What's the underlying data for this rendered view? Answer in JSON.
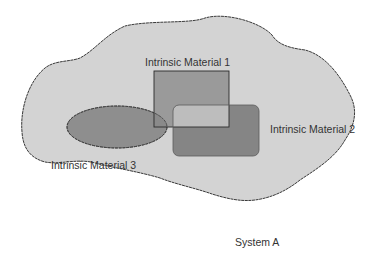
{
  "diagram": {
    "system": {
      "label": "System A",
      "fill": "#d3d3d3",
      "stroke": "#3a3a3a"
    },
    "materials": [
      {
        "id": 1,
        "label": "Intrinsic Material 1",
        "shape": "rectangle",
        "fill": "#9a9a9a"
      },
      {
        "id": 2,
        "label": "Intrinsic Material 2",
        "shape": "rounded-rectangle",
        "fill": "#858585"
      },
      {
        "id": 3,
        "label": "Intrinsic Material 3",
        "shape": "ellipse",
        "fill": "#8e8e8e"
      }
    ],
    "overlaps": {
      "m1_m2": "#bdbdbd",
      "m1_m2_m3": "#111111",
      "m2_m3": "#d0d0d0"
    }
  }
}
